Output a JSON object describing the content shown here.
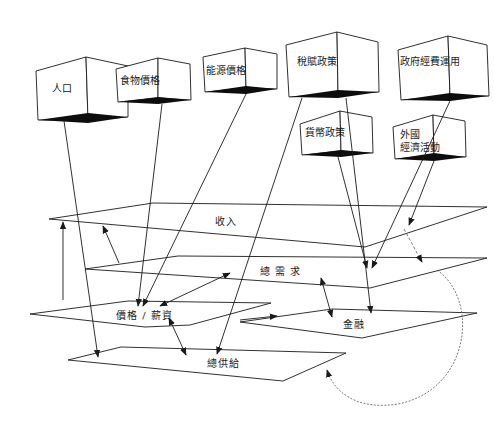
{
  "diagram": {
    "type": "3d-box-and-plane flow diagram",
    "colors": {
      "ink": "#1a1a1a",
      "background": "#ffffff",
      "shadow": "#0d0d0d",
      "dashed": "#555555"
    },
    "boxes": [
      {
        "id": "population",
        "label": "人口",
        "label_pos": [
          52,
          82
        ],
        "front": [
          [
            36,
            71
          ],
          [
            86,
            57
          ],
          [
            88,
            120
          ],
          [
            38,
            120
          ]
        ],
        "side": [
          [
            86,
            57
          ],
          [
            128,
            66
          ],
          [
            128,
            117
          ],
          [
            88,
            120
          ]
        ],
        "shadow": [
          [
            38,
            120
          ],
          [
            88,
            113
          ],
          [
            128,
            117
          ],
          [
            88,
            123
          ]
        ]
      },
      {
        "id": "food-price",
        "label": "食物價格",
        "label_pos": [
          120,
          74
        ],
        "front": [
          [
            116,
            69
          ],
          [
            158,
            58
          ],
          [
            158,
            98
          ],
          [
            118,
            102
          ]
        ],
        "side": [
          [
            158,
            58
          ],
          [
            190,
            64
          ],
          [
            191,
            100
          ],
          [
            158,
            98
          ]
        ],
        "shadow": [
          [
            118,
            102
          ],
          [
            158,
            97
          ],
          [
            191,
            100
          ],
          [
            158,
            104
          ]
        ]
      },
      {
        "id": "energy-price",
        "label": "能源價格",
        "label_pos": [
          206,
          64
        ],
        "front": [
          [
            203,
            57
          ],
          [
            245,
            48
          ],
          [
            246,
            88
          ],
          [
            205,
            92
          ]
        ],
        "side": [
          [
            245,
            48
          ],
          [
            277,
            54
          ],
          [
            277,
            89
          ],
          [
            246,
            88
          ]
        ],
        "shadow": [
          [
            205,
            92
          ],
          [
            246,
            86
          ],
          [
            277,
            89
          ],
          [
            246,
            94
          ]
        ]
      },
      {
        "id": "tax-policy",
        "label": "稅賦政策",
        "label_pos": [
          297,
          55
        ],
        "front": [
          [
            286,
            45
          ],
          [
            337,
            32
          ],
          [
            338,
            94
          ],
          [
            289,
            97
          ]
        ],
        "side": [
          [
            337,
            32
          ],
          [
            378,
            42
          ],
          [
            379,
            92
          ],
          [
            338,
            94
          ]
        ],
        "shadow": [
          [
            289,
            97
          ],
          [
            338,
            90
          ],
          [
            379,
            92
          ],
          [
            338,
            98
          ]
        ]
      },
      {
        "id": "government-spending",
        "label": "政府經費運用",
        "label_pos": [
          400,
          55
        ],
        "front": [
          [
            398,
            50
          ],
          [
            448,
            36
          ],
          [
            450,
            96
          ],
          [
            401,
            100
          ]
        ],
        "side": [
          [
            448,
            36
          ],
          [
            487,
            45
          ],
          [
            489,
            96
          ],
          [
            450,
            96
          ]
        ],
        "shadow": [
          [
            401,
            100
          ],
          [
            450,
            93
          ],
          [
            489,
            96
          ],
          [
            450,
            101
          ]
        ]
      },
      {
        "id": "monetary-policy",
        "label": "貨幣政策",
        "label_pos": [
          305,
          126
        ],
        "front": [
          [
            300,
            124
          ],
          [
            340,
            111
          ],
          [
            341,
            151
          ],
          [
            302,
            155
          ]
        ],
        "side": [
          [
            340,
            111
          ],
          [
            372,
            117
          ],
          [
            373,
            153
          ],
          [
            341,
            151
          ]
        ],
        "shadow": [
          [
            302,
            155
          ],
          [
            341,
            150
          ],
          [
            373,
            153
          ],
          [
            341,
            157
          ]
        ]
      },
      {
        "id": "foreign-economy",
        "label": "外國\n經濟活動",
        "label_pos": [
          400,
          128
        ],
        "front": [
          [
            393,
            127
          ],
          [
            433,
            115
          ],
          [
            434,
            155
          ],
          [
            395,
            159
          ]
        ],
        "side": [
          [
            433,
            115
          ],
          [
            465,
            121
          ],
          [
            466,
            157
          ],
          [
            434,
            155
          ]
        ],
        "shadow": [
          [
            395,
            159
          ],
          [
            434,
            153
          ],
          [
            466,
            157
          ],
          [
            434,
            161
          ]
        ]
      }
    ],
    "planes": [
      {
        "id": "income",
        "label": "收入",
        "label_pos": [
          215,
          215
        ],
        "points": [
          [
            49,
            219
          ],
          [
            153,
            203
          ],
          [
            487,
            207
          ],
          [
            365,
            247
          ],
          [
            49,
            219
          ]
        ]
      },
      {
        "id": "aggregate-demand",
        "label": "總 需 求",
        "label_pos": [
          260,
          265
        ],
        "points": [
          [
            85,
            269
          ],
          [
            178,
            256
          ],
          [
            487,
            258
          ],
          [
            370,
            288
          ],
          [
            85,
            269
          ]
        ]
      },
      {
        "id": "price-wage",
        "label": "價格 / 薪資",
        "label_pos": [
          116,
          309
        ],
        "points": [
          [
            30,
            314
          ],
          [
            128,
            301
          ],
          [
            271,
            303
          ],
          [
            190,
            325
          ],
          [
            145,
            327
          ],
          [
            30,
            314
          ]
        ]
      },
      {
        "id": "finance",
        "label": "金融",
        "label_pos": [
          343,
          318
        ],
        "points": [
          [
            240,
            322
          ],
          [
            332,
            309
          ],
          [
            477,
            313
          ],
          [
            362,
            338
          ],
          [
            240,
            322
          ]
        ]
      },
      {
        "id": "aggregate-supply",
        "label": "總供給",
        "label_pos": [
          207,
          357
        ],
        "points": [
          [
            68,
            360
          ],
          [
            121,
            347
          ],
          [
            346,
            353
          ],
          [
            283,
            381
          ],
          [
            68,
            360
          ]
        ]
      }
    ],
    "arrows": [
      {
        "from": [
          64,
          121
        ],
        "to": [
          98,
          357
        ],
        "head": "end",
        "desc": "人口 → 總供給"
      },
      {
        "from": [
          162,
          104
        ],
        "to": [
          138,
          306
        ],
        "head": "end",
        "desc": "食物價格 → 價格/薪資"
      },
      {
        "from": [
          246,
          94
        ],
        "to": [
          143,
          306
        ],
        "head": "end",
        "desc": "能源價格 → 價格/薪資"
      },
      {
        "from": [
          302,
          98
        ],
        "to": [
          217,
          354
        ],
        "head": "end",
        "desc": "稅賦政策 → 總供給"
      },
      {
        "from": [
          346,
          98
        ],
        "to": [
          371,
          313
        ],
        "head": "end",
        "desc": "稅賦政策 → 金融"
      },
      {
        "from": [
          338,
          157
        ],
        "to": [
          367,
          268
        ],
        "head": "end",
        "desc": "貨幣政策 → 總需求"
      },
      {
        "from": [
          450,
          101
        ],
        "to": [
          372,
          268
        ],
        "head": "end",
        "desc": "政府經費運用 → 總需求"
      },
      {
        "from": [
          434,
          161
        ],
        "to": [
          409,
          225
        ],
        "head": "end",
        "desc": "外國經濟活動 → 收入"
      },
      {
        "from": [
          63,
          300
        ],
        "to": [
          63,
          222
        ],
        "head": "end",
        "desc": "價格/薪資 → 收入"
      },
      {
        "from": [
          119,
          263
        ],
        "to": [
          103,
          226
        ],
        "head": "end",
        "desc": "總需求 → 收入"
      },
      {
        "from": [
          160,
          306
        ],
        "to": [
          230,
          273
        ],
        "head": "both",
        "desc": "價格/薪資 ↔ 總需求"
      },
      {
        "from": [
          169,
          318
        ],
        "to": [
          186,
          355
        ],
        "head": "both",
        "desc": "價格/薪資 ↔ 總供給"
      },
      {
        "from": [
          321,
          278
        ],
        "to": [
          332,
          317
        ],
        "head": "both",
        "desc": "總需求 ↔ 金融"
      },
      {
        "from": [
          240,
          320
        ],
        "to": [
          277,
          316
        ],
        "head": "end",
        "desc": "價格/薪資 → 金融"
      }
    ],
    "dashed_arrows": [
      {
        "from": [
          404,
          229
        ],
        "to": [
          422,
          262
        ],
        "desc": "收入 → 總需求 (dashed)"
      }
    ],
    "curved_arrow": {
      "path": "M 437 270 C 480 300, 470 390, 398 404 C 360 410, 335 395, 327 370",
      "head_at": [
        327,
        370
      ],
      "head_dir": [
        -0.4,
        -1
      ],
      "desc": "總需求 → 總供給 (curved, dotted end)"
    }
  }
}
